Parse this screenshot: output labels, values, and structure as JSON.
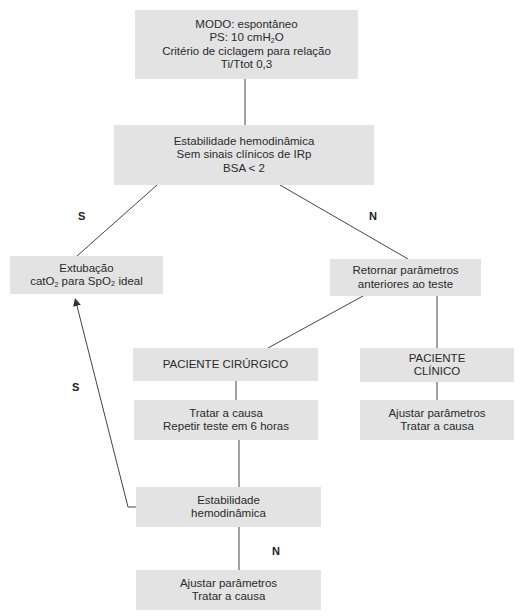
{
  "diagram": {
    "type": "flowchart",
    "colors": {
      "box_fill": "#e3e3e3",
      "line": "#333333",
      "text": "#2a2a2a",
      "background": "#ffffff"
    },
    "nodes": {
      "start": {
        "line1": "MODO: espontâneo",
        "line2_prefix": "PS: 10 cmH",
        "line2_sub": "2",
        "line2_suffix": "O",
        "line3": "Critério de ciclagem para relação",
        "line4": "Ti/Ttot 0,3"
      },
      "criteria": {
        "line1": "Estabilidade hemodinâmica",
        "line2": "Sem sinais clínicos de IRp",
        "line3": "BSA < 2"
      },
      "extubation": {
        "line1": "Extubação",
        "line2_prefix": "catO",
        "line2_sub": "2",
        "line2_suffix": " para SpO₂ ideal"
      },
      "return_params": {
        "line1": "Retornar parâmetros",
        "line2": "anteriores ao teste"
      },
      "surgical": {
        "line1": "PACIENTE CIRÚRGICO"
      },
      "clinical": {
        "line1": "PACIENTE",
        "line2": "CLÍNICO"
      },
      "treat_repeat": {
        "line1": "Tratar a causa",
        "line2": "Repetir teste em 6 horas"
      },
      "adjust_clinical": {
        "line1": "Ajustar parâmetros",
        "line2": "Tratar a causa"
      },
      "stability": {
        "line1": "Estabilidade",
        "line2": "hemodinâmica"
      },
      "adjust_final": {
        "line1": "Ajustar parâmetros",
        "line2": "Tratar a causa"
      }
    },
    "edge_labels": {
      "yes_to_extubation": "S",
      "no_to_return": "N",
      "yes_return_arrow": "S",
      "no_to_adjust": "N"
    }
  }
}
